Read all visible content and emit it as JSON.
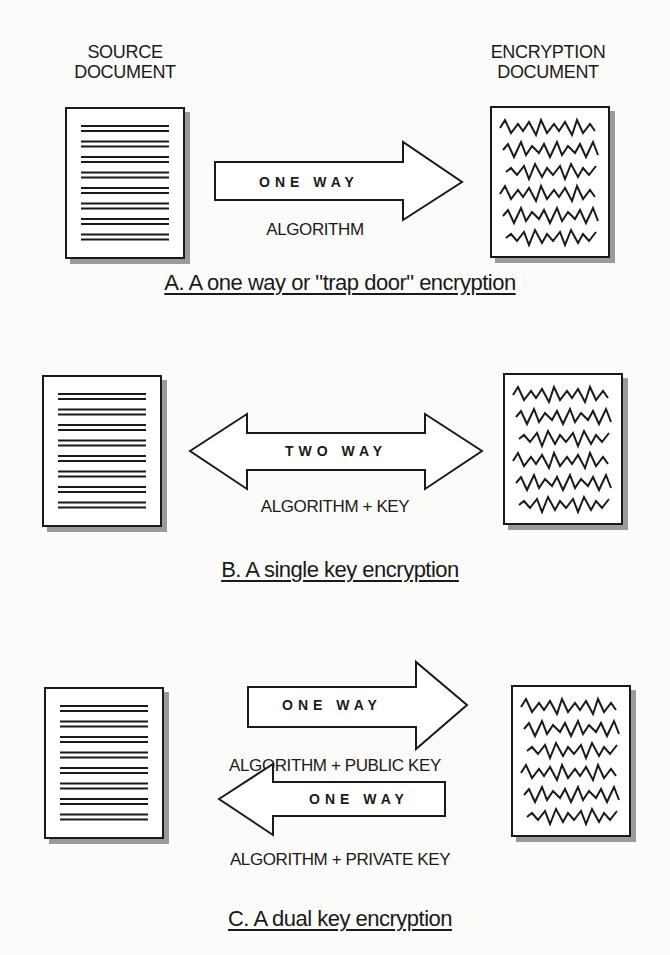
{
  "sections": {
    "a": {
      "source_header": [
        "SOURCE",
        "DOCUMENT"
      ],
      "encrypted_header": [
        "ENCRYPTION",
        "DOCUMENT"
      ],
      "arrow_label": "ONE WAY",
      "arrow_direction": "right",
      "sub_label": "ALGORITHM",
      "caption": "A. A one way or \"trap door\" encryption"
    },
    "b": {
      "arrow_label": "TWO WAY",
      "arrow_direction": "both",
      "sub_label": "ALGORITHM + KEY",
      "caption": "B. A single key encryption"
    },
    "c": {
      "arrow1_label": "ONE WAY",
      "arrow1_direction": "right",
      "sub_label1": "ALGORITHM + PUBLIC KEY",
      "arrow2_label": "ONE WAY",
      "arrow2_direction": "left",
      "sub_label2": "ALGORITHM + PRIVATE KEY",
      "caption": "C. A dual key encryption"
    }
  },
  "icons": {
    "plain_document": "document-with-lines-icon",
    "encrypted_document": "document-with-scribbles-icon"
  }
}
